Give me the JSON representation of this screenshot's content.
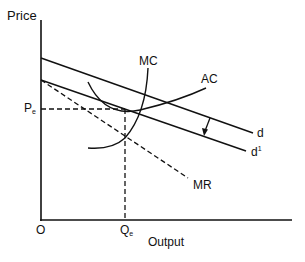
{
  "diagram": {
    "axes": {
      "y_label": "Price",
      "x_label": "Output",
      "origin_label": "O"
    },
    "equilibrium": {
      "price_label": "P",
      "price_sub": "e",
      "quantity_label": "Q",
      "quantity_sub": "e"
    },
    "curves": {
      "mc": "MC",
      "ac": "AC",
      "d": "d",
      "d1_base": "d",
      "d1_sup": "1",
      "mr": "MR"
    },
    "colors": {
      "line": "#111111",
      "background": "#ffffff"
    }
  }
}
